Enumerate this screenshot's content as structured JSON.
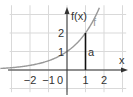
{
  "diagram": {
    "function": "f(x) = 2^x",
    "origin_px": [
      67,
      70
    ],
    "unit_px": 18.5,
    "x_range": [
      -3.1,
      3.2
    ],
    "y_range": [
      -1.2,
      3.5
    ],
    "colors": {
      "grid": "#d9d9d9",
      "axis": "#333333",
      "curve": "#999999",
      "segment": "#111111"
    },
    "labels": {
      "y_axis": "f(x)",
      "x_axis": "x",
      "curve": "f",
      "segment": "a",
      "origin": "0"
    },
    "x_ticks": [
      {
        "value": -2,
        "label": "−2"
      },
      {
        "value": -1,
        "label": "−1"
      },
      {
        "value": 1,
        "label": "1"
      },
      {
        "value": 2,
        "label": "2"
      }
    ],
    "y_ticks": [
      {
        "value": 1,
        "label": "1"
      },
      {
        "value": 2,
        "label": "2"
      }
    ],
    "segment_a": {
      "x": 1,
      "from_y": 0,
      "to_y": 2
    }
  }
}
